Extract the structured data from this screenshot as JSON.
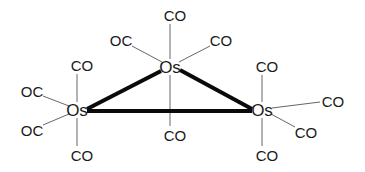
{
  "diagram": {
    "metals": [
      {
        "id": "os_top",
        "label": "Os",
        "x": 170,
        "y": 67
      },
      {
        "id": "os_left",
        "label": "Os",
        "x": 77,
        "y": 110
      },
      {
        "id": "os_right",
        "label": "Os",
        "x": 262,
        "y": 110
      }
    ],
    "metal_bonds": [
      {
        "from": "os_top",
        "to": "os_left",
        "x1": 161,
        "y1": 71,
        "x2": 87,
        "y2": 109
      },
      {
        "from": "os_top",
        "to": "os_right",
        "x1": 180,
        "y1": 70,
        "x2": 252,
        "y2": 109
      },
      {
        "from": "os_left",
        "to": "os_right",
        "x1": 87,
        "y1": 111,
        "x2": 252,
        "y2": 111
      }
    ],
    "ligands": [
      {
        "metal": "os_top",
        "label": "CO",
        "x": 175,
        "y": 15,
        "bx1": 170,
        "by1": 24,
        "bx2": 170,
        "by2": 59
      },
      {
        "metal": "os_top",
        "label": "OC",
        "x": 121,
        "y": 40,
        "bx1": 132,
        "by1": 46,
        "bx2": 162,
        "by2": 62
      },
      {
        "metal": "os_top",
        "label": "CO",
        "x": 221,
        "y": 40,
        "bx1": 210,
        "by1": 46,
        "bx2": 179,
        "by2": 62
      },
      {
        "metal": "os_top",
        "label": "CO",
        "x": 175,
        "y": 135,
        "bx1": 170,
        "by1": 75,
        "bx2": 170,
        "by2": 126
      },
      {
        "metal": "os_left",
        "label": "CO",
        "x": 82,
        "y": 65,
        "bx1": 77,
        "by1": 74,
        "bx2": 77,
        "by2": 102
      },
      {
        "metal": "os_left",
        "label": "OC",
        "x": 32,
        "y": 91,
        "bx1": 43,
        "by1": 96,
        "bx2": 69,
        "by2": 106
      },
      {
        "metal": "os_left",
        "label": "OC",
        "x": 32,
        "y": 130,
        "bx1": 43,
        "by1": 125,
        "bx2": 69,
        "by2": 114
      },
      {
        "metal": "os_left",
        "label": "CO",
        "x": 82,
        "y": 155,
        "bx1": 77,
        "by1": 118,
        "bx2": 77,
        "by2": 146
      },
      {
        "metal": "os_right",
        "label": "CO",
        "x": 267,
        "y": 66,
        "bx1": 262,
        "by1": 75,
        "bx2": 262,
        "by2": 102
      },
      {
        "metal": "os_right",
        "label": "CO",
        "x": 333,
        "y": 101,
        "bx1": 320,
        "by1": 102,
        "bx2": 272,
        "by2": 108
      },
      {
        "metal": "os_right",
        "label": "CO",
        "x": 306,
        "y": 132,
        "bx1": 295,
        "by1": 127,
        "bx2": 271,
        "by2": 114
      },
      {
        "metal": "os_right",
        "label": "CO",
        "x": 267,
        "y": 155,
        "bx1": 262,
        "by1": 118,
        "bx2": 262,
        "by2": 146
      }
    ]
  }
}
